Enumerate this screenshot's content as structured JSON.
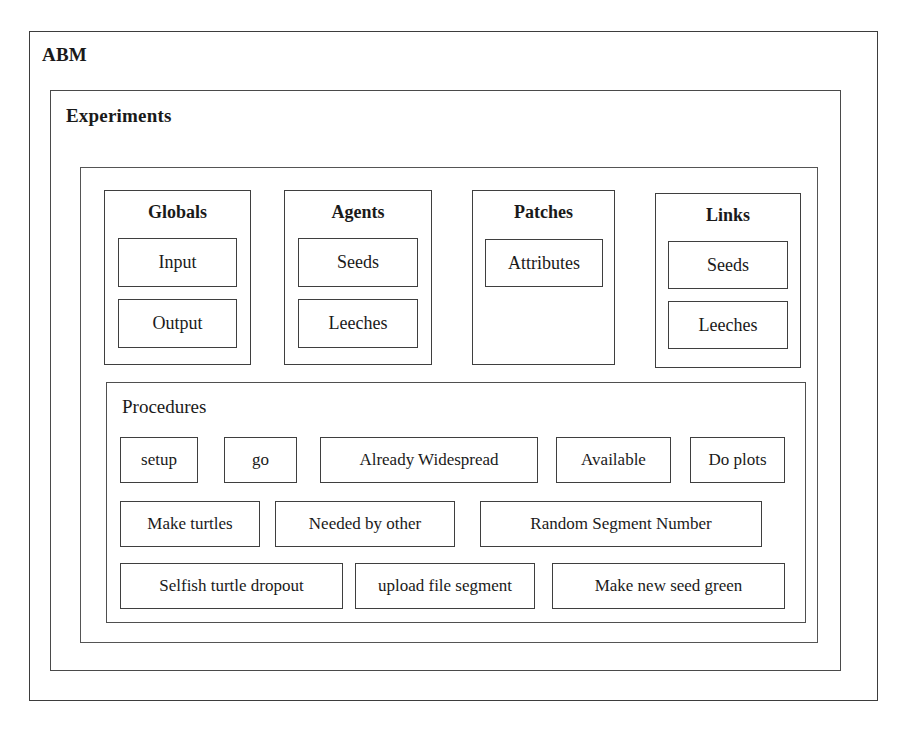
{
  "diagram": {
    "outer_frame_label": "ABM",
    "experiments_frame_label": "Experiments",
    "procedures_frame_label": "Procedures",
    "border_color": "#3f3f3f",
    "background_color": "#ffffff",
    "text_color": "#1a1a1a"
  },
  "groups": [
    {
      "title": "Globals",
      "items": [
        {
          "label": "Input"
        },
        {
          "label": "Output"
        }
      ]
    },
    {
      "title": "Agents",
      "items": [
        {
          "label": "Seeds"
        },
        {
          "label": "Leeches"
        }
      ]
    },
    {
      "title": "Patches",
      "items": [
        {
          "label": "Attributes"
        }
      ]
    },
    {
      "title": "Links",
      "items": [
        {
          "label": "Seeds"
        },
        {
          "label": "Leeches"
        }
      ]
    }
  ],
  "procedures": {
    "rows": [
      [
        {
          "label": "setup"
        },
        {
          "label": "go"
        },
        {
          "label": "Already Widespread"
        },
        {
          "label": "Available"
        },
        {
          "label": "Do plots"
        }
      ],
      [
        {
          "label": "Make turtles"
        },
        {
          "label": "Needed by other"
        },
        {
          "label": "Random Segment Number"
        }
      ],
      [
        {
          "label": "Selfish turtle dropout"
        },
        {
          "label": "upload file segment"
        },
        {
          "label": "Make new seed green"
        }
      ]
    ]
  }
}
